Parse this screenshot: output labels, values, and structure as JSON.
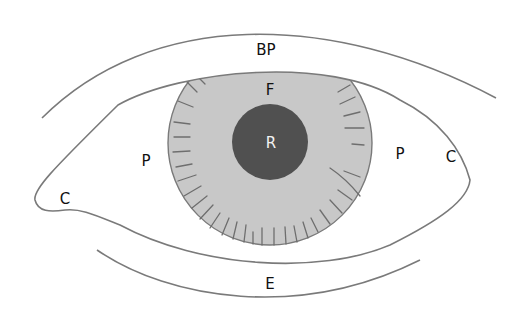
{
  "diagram": {
    "colors": {
      "outline": "#7a7a7a",
      "iris_fill": "#c8c8c8",
      "iris_streak": "#6e6e6e",
      "pupil_fill": "#505050",
      "background": "#ffffff",
      "label_dark": "#111111",
      "label_light": "#f2f2f2"
    },
    "labels": {
      "upper_lid": "BP",
      "iris_top": "F",
      "pupil": "R",
      "left_white": "P",
      "right_white": "P",
      "left_corner": "C",
      "right_corner": "C",
      "lower_lid": "E"
    }
  }
}
